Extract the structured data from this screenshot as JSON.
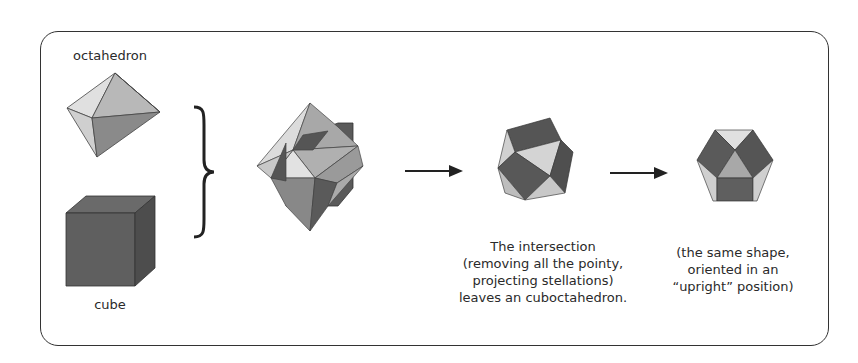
{
  "labels": {
    "octahedron": "octahedron",
    "cube": "cube",
    "intersection_caption": [
      "The intersection",
      "(removing all the pointy,",
      "projecting stellations)",
      "leaves an cuboctahedron."
    ],
    "upright_caption": [
      "(the same shape,",
      "oriented in an",
      "“upright” position)"
    ]
  },
  "shapes": [
    "octahedron",
    "cube",
    "compound-of-cube-and-octahedron",
    "cuboctahedron",
    "cuboctahedron-upright"
  ],
  "connectors": [
    "curly-brace",
    "arrow-right",
    "arrow-right"
  ],
  "colors": {
    "dark_face": "#5a5a5a",
    "mid_face": "#9a9a9a",
    "light_face": "#d8d8d8",
    "frame": "#333333"
  }
}
